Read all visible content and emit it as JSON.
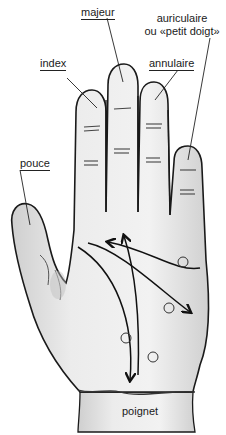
{
  "diagram": {
    "labels": {
      "majeur": "majeur",
      "auriculaire_line1": "auriculaire",
      "auriculaire_line2": "ou «petit doigt»",
      "index": "index",
      "annulaire": "annulaire",
      "pouce": "pouce",
      "poignet": "poignet"
    },
    "colors": {
      "outline": "#1a1a1a",
      "skin": "#e9e9e9",
      "shade": "#bdbdbd",
      "background": "#ffffff"
    },
    "markers": {
      "circle_count": 4,
      "arrow_count": 3
    }
  }
}
